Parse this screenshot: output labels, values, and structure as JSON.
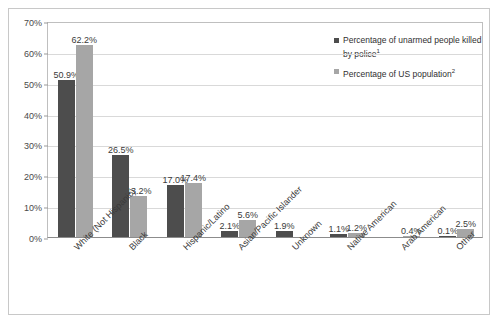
{
  "chart_data": {
    "type": "bar",
    "title": "",
    "xlabel": "",
    "ylabel": "",
    "ylim": [
      0,
      70
    ],
    "ytick_labels": [
      "0%",
      "10%",
      "20%",
      "30%",
      "40%",
      "50%",
      "60%",
      "70%"
    ],
    "ytick_values": [
      0,
      10,
      20,
      30,
      40,
      50,
      60,
      70
    ],
    "grid": true,
    "legend_position": "top-right",
    "categories": [
      "White (Not Hispanic)",
      "Black",
      "Hispanic/Latino",
      "Asian/Pacific Islander",
      "Unknown",
      "Native American",
      "Arab American",
      "Other"
    ],
    "series": [
      {
        "name": "Percentage of unarmed people killed by police",
        "footnote": "1",
        "color": "#4d4d4d",
        "values": [
          50.9,
          26.5,
          17.0,
          2.1,
          1.9,
          1.1,
          null,
          0.1
        ],
        "labels": [
          "50.9%",
          "26.5%",
          "17.0%",
          "2.1%",
          "1.9%",
          "1.1%",
          "",
          "0.1%"
        ]
      },
      {
        "name": "Percentage of US population",
        "footnote": "2",
        "color": "#a6a6a6",
        "values": [
          62.2,
          13.2,
          17.4,
          5.6,
          null,
          1.2,
          0.4,
          2.5
        ],
        "labels": [
          "62.2%",
          "13.2%",
          "17.4%",
          "5.6%",
          "",
          "1.2%",
          "0.4%",
          "2.5%"
        ]
      }
    ]
  },
  "legend": {
    "entries": [
      {
        "label": "Percentage of unarmed people killed by police",
        "footnote": "1"
      },
      {
        "label": "Percentage of US population",
        "footnote": "2"
      }
    ]
  },
  "colors": {
    "series1": "#4d4d4d",
    "series2": "#a6a6a6",
    "grid": "#d9d9d9",
    "axis": "#8c8c8c",
    "frame": "#c8c8c8",
    "background": "#ffffff"
  }
}
